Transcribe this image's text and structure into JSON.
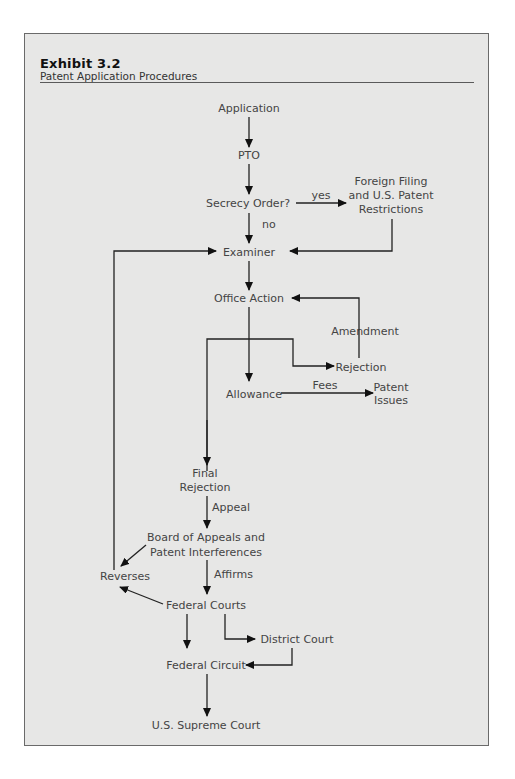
{
  "exhibit": {
    "label": "Exhibit 3.2",
    "title": "Patent Application Procedures"
  },
  "nodes": {
    "application": "Application",
    "pto": "PTO",
    "secrecy_order": "Secrecy Order?",
    "foreign_filing_1": "Foreign Filing",
    "foreign_filing_2": "and U.S. Patent",
    "foreign_filing_3": "Restrictions",
    "examiner": "Examiner",
    "office_action": "Office Action",
    "rejection": "Rejection",
    "allowance": "Allowance",
    "patent_issues_1": "Patent",
    "patent_issues_2": "Issues",
    "final_rejection_1": "Final",
    "final_rejection_2": "Rejection",
    "board_1": "Board of Appeals and",
    "board_2": "Patent Interferences",
    "reverses": "Reverses",
    "federal_courts": "Federal Courts",
    "district_court": "District Court",
    "federal_circuit": "Federal Circuit",
    "supreme_court": "U.S. Supreme Court"
  },
  "edge_labels": {
    "yes": "yes",
    "no": "no",
    "amendment": "Amendment",
    "fees": "Fees",
    "appeal": "Appeal",
    "affirms": "Affirms"
  },
  "edges": [
    {
      "from": "Application",
      "to": "PTO"
    },
    {
      "from": "PTO",
      "to": "Secrecy Order?"
    },
    {
      "from": "Secrecy Order?",
      "to": "Foreign Filing and U.S. Patent Restrictions",
      "label": "yes"
    },
    {
      "from": "Secrecy Order?",
      "to": "Examiner",
      "label": "no"
    },
    {
      "from": "Foreign Filing and U.S. Patent Restrictions",
      "to": "Examiner"
    },
    {
      "from": "Examiner",
      "to": "Office Action"
    },
    {
      "from": "Office Action",
      "to": "Rejection"
    },
    {
      "from": "Office Action",
      "to": "Allowance"
    },
    {
      "from": "Office Action",
      "to": "Final Rejection"
    },
    {
      "from": "Rejection",
      "to": "Office Action",
      "label": "Amendment"
    },
    {
      "from": "Allowance",
      "to": "Patent Issues",
      "label": "Fees"
    },
    {
      "from": "Final Rejection",
      "to": "Board of Appeals and Patent Interferences",
      "label": "Appeal"
    },
    {
      "from": "Board of Appeals and Patent Interferences",
      "to": "Reverses"
    },
    {
      "from": "Board of Appeals and Patent Interferences",
      "to": "Federal Courts",
      "label": "Affirms"
    },
    {
      "from": "Federal Courts",
      "to": "Reverses"
    },
    {
      "from": "Reverses",
      "to": "Examiner"
    },
    {
      "from": "Federal Courts",
      "to": "Federal Circuit"
    },
    {
      "from": "Federal Courts",
      "to": "District Court"
    },
    {
      "from": "District Court",
      "to": "Federal Circuit"
    },
    {
      "from": "Federal Circuit",
      "to": "U.S. Supreme Court"
    }
  ]
}
